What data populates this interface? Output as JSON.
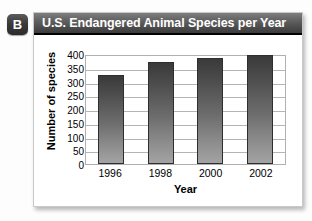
{
  "badge": {
    "label": "B"
  },
  "panel": {
    "title": "U.S. Endangered Animal Species per Year"
  },
  "chart_data": {
    "type": "bar",
    "title": "U.S. Endangered Animal Species per Year",
    "xlabel": "Year",
    "ylabel": "Number of species",
    "categories": [
      "1996",
      "1998",
      "2000",
      "2002"
    ],
    "values": [
      325,
      370,
      385,
      395
    ],
    "ylim": [
      0,
      400
    ],
    "ytick_labels": [
      "400",
      "350",
      "300",
      "250",
      "200",
      "150",
      "100",
      "50",
      "0"
    ],
    "ytick_values": [
      400,
      350,
      300,
      250,
      200,
      150,
      100,
      50,
      0
    ],
    "grid": true,
    "legend": "none",
    "bar_color_top": "#3a3a3a",
    "bar_color_bottom": "#a3a3a3"
  }
}
